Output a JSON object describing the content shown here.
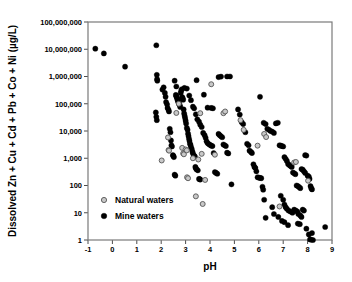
{
  "chart_data": {
    "type": "scatter",
    "title": "",
    "xlabel": "pH",
    "ylabel": "Dissolved Zn + Cu + Cd + Pb + Co + Ni (µg/L)",
    "xlim": [
      -1,
      9
    ],
    "ylim": [
      1,
      100000000
    ],
    "yscale": "log",
    "xscale": "linear",
    "grid": false,
    "legend_position": "lower-left-inside",
    "xticks": [
      -1,
      0,
      1,
      2,
      3,
      4,
      5,
      6,
      7,
      8,
      9
    ],
    "xtick_labels": [
      "-1",
      "0",
      "1",
      "2",
      "3",
      "4",
      "5",
      "6",
      "7",
      "8",
      "9"
    ],
    "yticks": [
      1,
      10,
      100,
      1000,
      10000,
      100000,
      1000000,
      10000000,
      100000000
    ],
    "ytick_labels": [
      "1",
      "10",
      "100",
      "1,000",
      "10,000",
      "100,000",
      "1,000,000",
      "10,000,000",
      "100,000,000"
    ],
    "series": [
      {
        "name": "Natural waters",
        "marker": "open-circle",
        "color": "#c8c8c8",
        "edge_color": "#555555",
        "points": [
          [
            2.02,
            830
          ],
          [
            2.28,
            5800
          ],
          [
            2.3,
            2000
          ],
          [
            2.32,
            1900
          ],
          [
            2.62,
            46000
          ],
          [
            2.72,
            100000
          ],
          [
            2.86,
            2400
          ],
          [
            2.9,
            1500
          ],
          [
            2.93,
            1400
          ],
          [
            3.0,
            2100
          ],
          [
            3.05,
            1950
          ],
          [
            3.06,
            200
          ],
          [
            3.1,
            185
          ],
          [
            3.3,
            1000
          ],
          [
            3.42,
            40
          ],
          [
            3.52,
            900
          ],
          [
            3.6,
            45000
          ],
          [
            3.66,
            1450
          ],
          [
            3.7,
            21
          ],
          [
            3.8,
            160
          ],
          [
            4.05,
            520000
          ],
          [
            4.2,
            1350
          ],
          [
            4.55,
            45000
          ],
          [
            4.62,
            52000
          ],
          [
            5.25,
            25000
          ],
          [
            5.38,
            11000
          ],
          [
            5.95,
            2900
          ],
          [
            6.22,
            7800
          ],
          [
            6.3,
            6000
          ],
          [
            6.85,
            17
          ],
          [
            7.45,
            700
          ],
          [
            7.52,
            730
          ],
          [
            8.02,
            150
          ]
        ]
      },
      {
        "name": "Mine waters",
        "marker": "filled-circle",
        "color": "#000000",
        "edge_color": "#000000",
        "points": [
          [
            -0.7,
            10500000
          ],
          [
            -0.35,
            7000000
          ],
          [
            0.52,
            2300000
          ],
          [
            1.8,
            14000000
          ],
          [
            1.82,
            1150000
          ],
          [
            1.83,
            800000
          ],
          [
            1.84,
            700000
          ],
          [
            1.78,
            48000
          ],
          [
            1.8,
            33000
          ],
          [
            1.82,
            25000
          ],
          [
            2.05,
            330000
          ],
          [
            2.1,
            400000
          ],
          [
            2.15,
            250000
          ],
          [
            2.18,
            180000
          ],
          [
            2.2,
            115000
          ],
          [
            2.24,
            95000
          ],
          [
            2.26,
            70000
          ],
          [
            2.3,
            60000
          ],
          [
            2.32,
            52000
          ],
          [
            2.35,
            12000
          ],
          [
            2.38,
            9000
          ],
          [
            2.4,
            4500
          ],
          [
            2.42,
            3000
          ],
          [
            2.44,
            2700
          ],
          [
            2.48,
            1300
          ],
          [
            2.5,
            1200
          ],
          [
            2.52,
            1100
          ],
          [
            2.55,
            250
          ],
          [
            2.58,
            230
          ],
          [
            2.6,
            210000
          ],
          [
            2.62,
            190000
          ],
          [
            2.64,
            170000
          ],
          [
            2.66,
            150000
          ],
          [
            2.68,
            130000
          ],
          [
            2.7,
            120000
          ],
          [
            2.72,
            105000
          ],
          [
            2.74,
            98000
          ],
          [
            2.76,
            88000
          ],
          [
            2.78,
            76000
          ],
          [
            2.8,
            250000
          ],
          [
            2.82,
            300000
          ],
          [
            2.84,
            340000
          ],
          [
            2.86,
            175000
          ],
          [
            2.88,
            160000
          ],
          [
            2.9,
            140000
          ],
          [
            2.92,
            62000
          ],
          [
            2.94,
            44000
          ],
          [
            2.96,
            36000
          ],
          [
            2.98,
            30000
          ],
          [
            3.0,
            24000
          ],
          [
            3.02,
            19000
          ],
          [
            3.05,
            13000
          ],
          [
            3.08,
            11000
          ],
          [
            3.1,
            8000
          ],
          [
            3.12,
            6500
          ],
          [
            3.14,
            5200
          ],
          [
            3.16,
            4300
          ],
          [
            3.18,
            3400
          ],
          [
            3.2,
            3100
          ],
          [
            3.22,
            2600
          ],
          [
            3.25,
            2200
          ],
          [
            3.28,
            1750
          ],
          [
            3.3,
            1500
          ],
          [
            3.35,
            1250
          ],
          [
            3.38,
            1150
          ],
          [
            3.4,
            480
          ],
          [
            3.42,
            430
          ],
          [
            3.45,
            390
          ],
          [
            3.5,
            360
          ],
          [
            3.55,
            175
          ],
          [
            3.58,
            170
          ],
          [
            3.6,
            165
          ],
          [
            2.55,
            700000
          ],
          [
            2.62,
            430000
          ],
          [
            2.95,
            380000
          ],
          [
            3.05,
            360000
          ],
          [
            3.15,
            200000
          ],
          [
            3.22,
            135000
          ],
          [
            3.3,
            78000
          ],
          [
            3.35,
            68000
          ],
          [
            3.42,
            41000
          ],
          [
            3.48,
            27000
          ],
          [
            3.55,
            22000
          ],
          [
            3.6,
            17000
          ],
          [
            3.66,
            14000
          ],
          [
            3.72,
            8500
          ],
          [
            3.78,
            7000
          ],
          [
            3.82,
            5600
          ],
          [
            3.86,
            4200
          ],
          [
            3.9,
            3600
          ],
          [
            3.95,
            3300
          ],
          [
            4.0,
            3100
          ],
          [
            4.05,
            2900
          ],
          [
            4.1,
            2800
          ],
          [
            4.15,
            1550
          ],
          [
            4.2,
            310
          ],
          [
            4.25,
            290
          ],
          [
            4.3,
            270
          ],
          [
            3.45,
            730000
          ],
          [
            3.75,
            215000
          ],
          [
            3.9,
            72000
          ],
          [
            4.05,
            70000
          ],
          [
            4.12,
            68000
          ],
          [
            4.35,
            7800
          ],
          [
            4.4,
            7000
          ],
          [
            4.45,
            6400
          ],
          [
            4.5,
            5900
          ],
          [
            4.55,
            3200
          ],
          [
            4.6,
            3000
          ],
          [
            4.65,
            2800
          ],
          [
            4.7,
            1600
          ],
          [
            4.75,
            1500
          ],
          [
            4.88,
            110
          ],
          [
            4.35,
            950000
          ],
          [
            4.45,
            990000
          ],
          [
            4.7,
            1000000
          ],
          [
            4.82,
            1000000
          ],
          [
            5.15,
            62000
          ],
          [
            5.22,
            40000
          ],
          [
            5.3,
            21000
          ],
          [
            5.36,
            18000
          ],
          [
            5.45,
            9000
          ],
          [
            5.52,
            3400
          ],
          [
            5.58,
            3000
          ],
          [
            5.62,
            1900
          ],
          [
            5.68,
            1700
          ],
          [
            5.72,
            1550
          ],
          [
            5.78,
            600
          ],
          [
            5.82,
            480
          ],
          [
            5.86,
            440
          ],
          [
            5.9,
            330
          ],
          [
            5.95,
            200
          ],
          [
            6.0,
            195
          ],
          [
            6.05,
            190
          ],
          [
            6.1,
            185
          ],
          [
            6.15,
            90
          ],
          [
            6.18,
            70
          ],
          [
            6.22,
            30
          ],
          [
            6.28,
            6.5
          ],
          [
            6.05,
            180000
          ],
          [
            6.2,
            20000
          ],
          [
            6.28,
            18000
          ],
          [
            6.35,
            12000
          ],
          [
            6.42,
            11000
          ],
          [
            6.48,
            10000
          ],
          [
            6.55,
            9500
          ],
          [
            6.62,
            8500
          ],
          [
            6.7,
            19000
          ],
          [
            6.78,
            20000
          ],
          [
            6.85,
            3000
          ],
          [
            6.9,
            2900
          ],
          [
            6.95,
            2800
          ],
          [
            7.0,
            2700
          ],
          [
            7.05,
            1100
          ],
          [
            7.1,
            950
          ],
          [
            7.15,
            800
          ],
          [
            7.2,
            620
          ],
          [
            7.25,
            560
          ],
          [
            7.3,
            520
          ],
          [
            7.35,
            480
          ],
          [
            7.4,
            300
          ],
          [
            7.45,
            280
          ],
          [
            7.5,
            260
          ],
          [
            7.55,
            100
          ],
          [
            7.6,
            95
          ],
          [
            7.65,
            88
          ],
          [
            7.7,
            80
          ],
          [
            7.75,
            400
          ],
          [
            7.8,
            380
          ],
          [
            7.85,
            330
          ],
          [
            7.9,
            290
          ],
          [
            6.9,
            42
          ],
          [
            7.0,
            30
          ],
          [
            7.05,
            20
          ],
          [
            7.1,
            16
          ],
          [
            7.15,
            14
          ],
          [
            7.22,
            12
          ],
          [
            7.3,
            11
          ],
          [
            7.38,
            10
          ],
          [
            7.45,
            13
          ],
          [
            7.52,
            12
          ],
          [
            7.58,
            11
          ],
          [
            7.62,
            9
          ],
          [
            7.7,
            8
          ],
          [
            7.75,
            7
          ],
          [
            7.8,
            13
          ],
          [
            7.85,
            12
          ],
          [
            6.55,
            16
          ],
          [
            6.62,
            9
          ],
          [
            6.8,
            7
          ],
          [
            6.95,
            5
          ],
          [
            7.05,
            4.5
          ],
          [
            7.2,
            3.5
          ],
          [
            7.6,
            4
          ],
          [
            7.68,
            3.8
          ],
          [
            7.95,
            2.6
          ],
          [
            8.05,
            1.6
          ],
          [
            8.1,
            1.05
          ],
          [
            8.15,
            1.02
          ],
          [
            8.18,
            1.8
          ],
          [
            8.22,
            1.0
          ],
          [
            8.72,
            3.0
          ],
          [
            7.9,
            1300
          ],
          [
            7.95,
            1250
          ],
          [
            8.0,
            230
          ],
          [
            8.05,
            210
          ],
          [
            8.08,
            175
          ],
          [
            8.12,
            95
          ],
          [
            8.15,
            80
          ],
          [
            8.18,
            72
          ]
        ]
      }
    ]
  },
  "legend": {
    "items": [
      {
        "label": "Natural waters",
        "marker": "open-circle"
      },
      {
        "label": "Mine waters",
        "marker": "filled-circle"
      }
    ]
  },
  "colors": {
    "natural_fill": "#c8c8c8",
    "natural_edge": "#555555",
    "mine_fill": "#000000",
    "axis": "#7a7a7a",
    "text": "#000000"
  }
}
